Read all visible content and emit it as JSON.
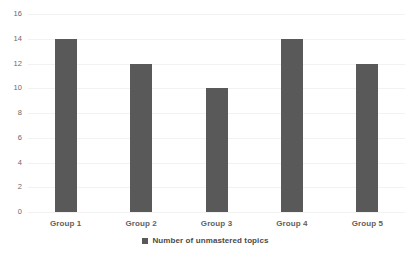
{
  "chart_data": {
    "type": "bar",
    "title": "",
    "xlabel": "",
    "ylabel": "",
    "categories": [
      "Group 1",
      "Group 2",
      "Group 3",
      "Group 4",
      "Group 5"
    ],
    "values": [
      14,
      12,
      10,
      14,
      12
    ],
    "series": [
      {
        "name": "Number of unmastered topics",
        "values": [
          14,
          12,
          10,
          14,
          12
        ],
        "color": "#595959"
      }
    ],
    "ylim": [
      0,
      16
    ],
    "ytick_step": 2,
    "yticks": [
      16,
      14,
      12,
      10,
      8,
      6,
      4,
      2,
      0
    ],
    "ytick_labels": [
      "16",
      "14",
      "12",
      "10",
      "8",
      "6",
      "4",
      "2",
      "0"
    ],
    "grid": true,
    "grid_axis": "y",
    "grid_color": "#f2f2f2",
    "legend": {
      "position": "bottom",
      "entries": [
        {
          "label": "Number of unmastered topics",
          "marker": "legend-square-marker",
          "color": "#595959"
        }
      ]
    },
    "background_color": "#ffffff",
    "bar_color": "#595959",
    "axis_label_color": "#5f5f5f"
  }
}
